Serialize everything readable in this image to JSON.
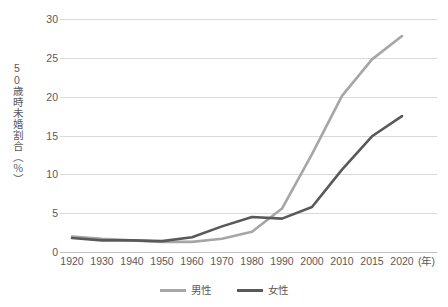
{
  "chart_data": {
    "type": "line",
    "title": "",
    "ylabel": "50歳時未婚割合（％）",
    "xlabel": "(年)",
    "categories": [
      "1920",
      "1930",
      "1940",
      "1950",
      "1960",
      "1970",
      "1980",
      "1990",
      "2000",
      "2010",
      "2015",
      "2020"
    ],
    "x": [
      1920,
      1930,
      1940,
      1950,
      1960,
      1970,
      1980,
      1990,
      2000,
      2010,
      2015,
      2020
    ],
    "yticks": [
      0,
      5,
      10,
      15,
      20,
      25,
      30
    ],
    "ylim": [
      0,
      30
    ],
    "grid": true,
    "legend_position": "bottom",
    "series": [
      {
        "name": "男性",
        "color": "#a6a6a6",
        "values": [
          2.0,
          1.7,
          1.5,
          1.3,
          1.3,
          1.7,
          2.6,
          5.6,
          12.6,
          20.1,
          24.8,
          27.8
        ]
      },
      {
        "name": "女性",
        "color": "#595959",
        "values": [
          1.8,
          1.5,
          1.5,
          1.4,
          1.9,
          3.3,
          4.5,
          4.3,
          5.8,
          10.6,
          14.9,
          17.5
        ]
      }
    ]
  },
  "yaxis": {
    "title": "50歳時未婚割合（％）",
    "ticks": [
      "30",
      "25",
      "20",
      "15",
      "10",
      "5",
      "0"
    ]
  },
  "xaxis": {
    "ticks": [
      "1920",
      "1930",
      "1940",
      "1950",
      "1960",
      "1970",
      "1980",
      "1990",
      "2000",
      "2010",
      "2015",
      "2020"
    ],
    "unit": "(年)"
  },
  "legend": {
    "items": [
      {
        "label": "男性",
        "color": "#a6a6a6"
      },
      {
        "label": "女性",
        "color": "#595959"
      }
    ]
  },
  "colors": {
    "male_line": "#a6a6a6",
    "female_line": "#595959",
    "gridline": "#d9d9d9",
    "text": "#595959",
    "background": "#ffffff"
  }
}
